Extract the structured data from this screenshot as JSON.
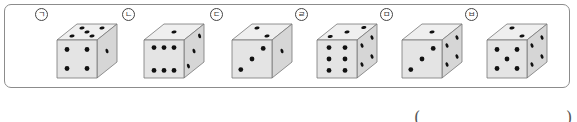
{
  "problem": {
    "dice": [
      {
        "label": "ㄱ",
        "top": 5,
        "front": 4,
        "right": 1,
        "x": 35
      },
      {
        "label": "ㄴ",
        "top": 1,
        "front": 6,
        "right": 3,
        "x": 122
      },
      {
        "label": "ㄷ",
        "top": 2,
        "front": 3,
        "right": 1,
        "x": 210
      },
      {
        "label": "ㄹ",
        "top": 3,
        "front": 6,
        "right": 4,
        "x": 295
      },
      {
        "label": "ㅁ",
        "top": 1,
        "front": 3,
        "right": 4,
        "x": 380
      },
      {
        "label": "ㅂ",
        "top": 2,
        "front": 5,
        "right": 4,
        "x": 465
      }
    ],
    "answer": {
      "open_paren": "(",
      "close_paren": ")",
      "value": ""
    }
  },
  "colors": {
    "face_front": "#e4e4e4",
    "face_top": "#efefef",
    "face_right": "#d6d6d6",
    "edge": "#777777",
    "pip": "#111111",
    "border": "#8c8c8c"
  }
}
